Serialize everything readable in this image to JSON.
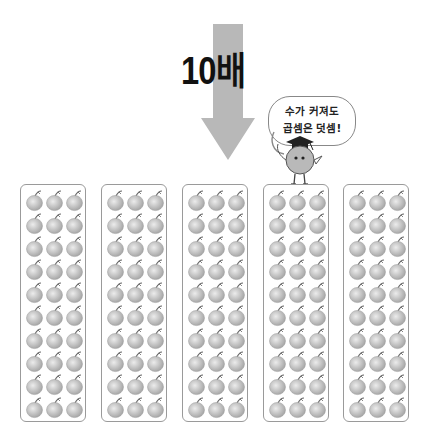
{
  "title": "10배",
  "speech_bubble": {
    "line1": "수가 커져도",
    "line2": "곱셈은 덧셈!"
  },
  "arrow": {
    "direction": "down",
    "color": "#b8b8b8"
  },
  "panels": [
    {
      "rows": 10,
      "columns": 3,
      "count": 30
    },
    {
      "rows": 10,
      "columns": 3,
      "count": 30
    },
    {
      "rows": 10,
      "columns": 3,
      "count": 30
    },
    {
      "rows": 10,
      "columns": 3,
      "count": 30
    },
    {
      "rows": 10,
      "columns": 3,
      "count": 30
    }
  ],
  "item_icon": "apple-icon",
  "colors": {
    "panel_border": "#9a9a9a",
    "apple_fill": "#cfcfcf",
    "mascot_fill": "#b9b9b9"
  }
}
